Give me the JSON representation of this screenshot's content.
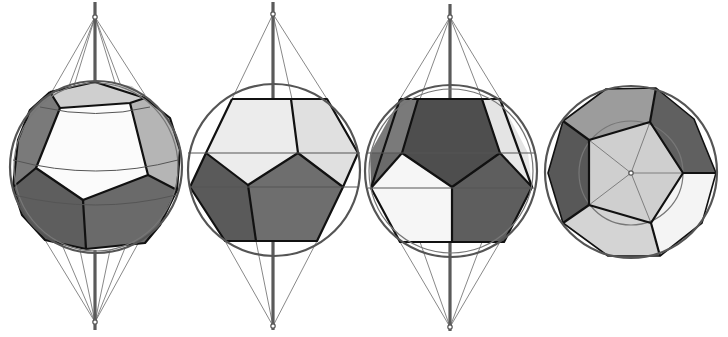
{
  "figure": {
    "title": "",
    "colors": {
      "white_face": "#fbfbfb",
      "light_face": "#d9d9d9",
      "mid_face": "#a8a8a8",
      "dark_face": "#6e6e6e",
      "darker_face": "#5a5a5a",
      "edge": "#111111",
      "sphere": "#555555",
      "construction": "#6a6a6a"
    },
    "views": [
      {
        "id": "view-1",
        "label": "",
        "orientation": "oblique-tilted"
      },
      {
        "id": "view-2",
        "label": "",
        "orientation": "edge-on-front-light-top"
      },
      {
        "id": "view-3",
        "label": "",
        "orientation": "edge-on-front-dark-top"
      },
      {
        "id": "view-4",
        "label": "",
        "orientation": "top-down-face-centered"
      }
    ]
  }
}
